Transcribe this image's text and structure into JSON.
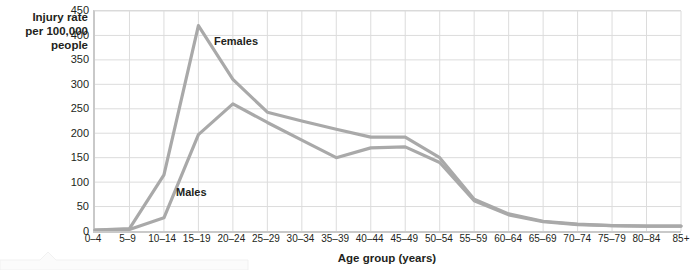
{
  "chart_data": {
    "type": "line",
    "title": "",
    "xlabel": "Age group (years)",
    "ylabel": "Injury rate\nper 100,000\npeople",
    "categories": [
      "0–4",
      "5–9",
      "10–14",
      "15–19",
      "20–24",
      "25–29",
      "30–34",
      "35–39",
      "40–44",
      "45–49",
      "50–54",
      "55–59",
      "60–64",
      "65–69",
      "70–74",
      "75–79",
      "80–84",
      "85+"
    ],
    "series": [
      {
        "name": "Females",
        "color": "#a9a9a9",
        "values": [
          2,
          5,
          115,
          420,
          310,
          243,
          225,
          208,
          192,
          192,
          150,
          65,
          35,
          20,
          14,
          11,
          10,
          10
        ]
      },
      {
        "name": "Males",
        "color": "#a9a9a9",
        "values": [
          2,
          3,
          27,
          197,
          260,
          222,
          186,
          150,
          170,
          172,
          140,
          62,
          33,
          19,
          13,
          11,
          10,
          10
        ]
      }
    ],
    "yticks": [
      0,
      50,
      100,
      150,
      200,
      250,
      300,
      350,
      400,
      450
    ],
    "ylim": [
      0,
      450
    ],
    "grid": true,
    "legend_position": "inline-annotation",
    "annotations": [
      {
        "text": "Females",
        "series": "Females"
      },
      {
        "text": "Males",
        "series": "Males"
      }
    ]
  },
  "axes": {
    "y_title": "Injury rate\nper 100,000\npeople",
    "x_title": "Age group (years)"
  },
  "colors": {
    "line": "#a9a9a9",
    "grid": "#dcdcdc",
    "axis": "#c9c9c9",
    "text": "#231f20",
    "background": "#ffffff"
  }
}
